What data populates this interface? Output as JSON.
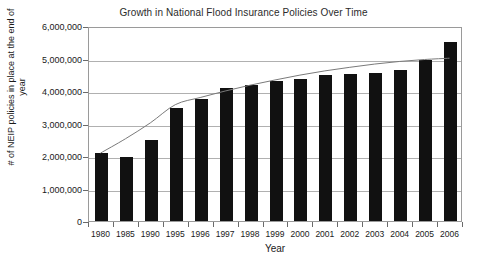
{
  "chart_data": {
    "type": "bar",
    "title": "Growth in National Flood Insurance Policies Over Time",
    "xlabel": "Year",
    "ylabel": "# of NEIP policies in place at the end of year",
    "categories": [
      "1980",
      "1985",
      "1990",
      "1995",
      "1996",
      "1997",
      "1998",
      "1999",
      "2000",
      "2001",
      "2002",
      "2003",
      "2004",
      "2005",
      "2006"
    ],
    "values": [
      2100000,
      1980000,
      2480000,
      3480000,
      3740000,
      4100000,
      4200000,
      4300000,
      4370000,
      4500000,
      4520000,
      4560000,
      4660000,
      4950000,
      5500000
    ],
    "ylim": [
      0,
      6000000
    ],
    "ytick_labels": [
      "0",
      "1,000,000",
      "2,000,000",
      "3,000,000",
      "4,000,000",
      "5,000,000",
      "6,000,000"
    ],
    "ytick_values": [
      0,
      1000000,
      2000000,
      3000000,
      4000000,
      5000000,
      6000000
    ],
    "grid": true,
    "legend": "none",
    "bar_color": "#111111",
    "gridline_color": "#b0b0b0",
    "axis_color": "#9a9a9a",
    "series": [
      {
        "name": "Policies in force",
        "type": "bar",
        "values": [
          2100000,
          1980000,
          2480000,
          3480000,
          3740000,
          4100000,
          4200000,
          4300000,
          4370000,
          4500000,
          4520000,
          4560000,
          4660000,
          4950000,
          5500000
        ]
      },
      {
        "name": "Trend line",
        "type": "line",
        "color": "#7a7a7a",
        "values": [
          2120000,
          2560000,
          3050000,
          3610000,
          3830000,
          4030000,
          4210000,
          4370000,
          4520000,
          4650000,
          4760000,
          4860000,
          4940000,
          5000000,
          5040000
        ]
      }
    ]
  }
}
